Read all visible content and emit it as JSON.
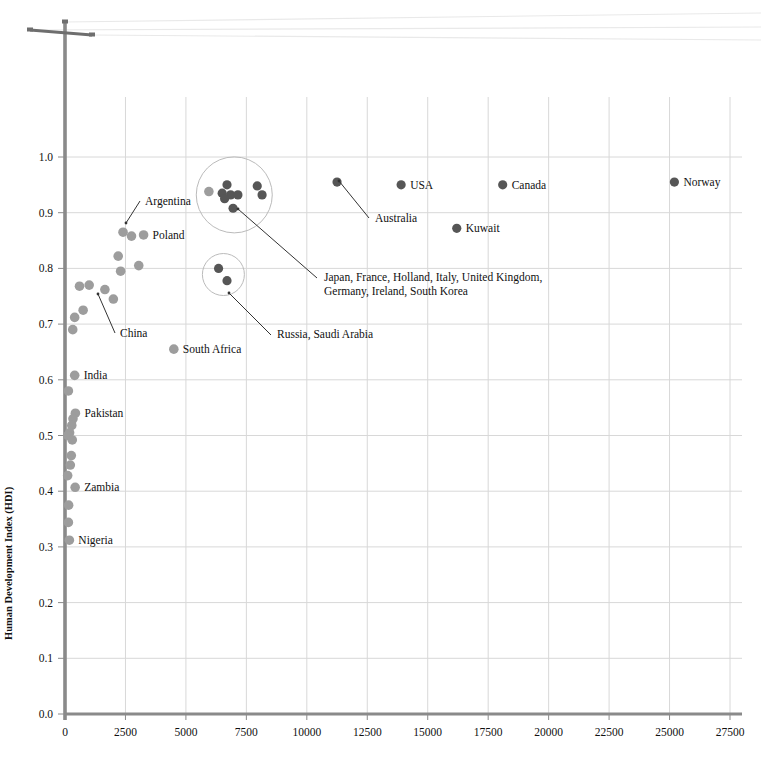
{
  "chart_data": {
    "type": "scatter",
    "title": "",
    "xlabel": "",
    "ylabel": "Human Development Index (HDI)",
    "xlim": [
      0,
      27500
    ],
    "ylim": [
      0.0,
      1.0
    ],
    "grid": true,
    "legend": "none",
    "xticks": [
      0,
      2500,
      5000,
      7500,
      10000,
      12500,
      15000,
      17500,
      20000,
      22500,
      25000,
      27500
    ],
    "xtick_labels": [
      "0",
      "2500",
      "5000",
      "7500",
      "10000",
      "12500",
      "15000",
      "17500",
      "20000",
      "22500",
      "25000",
      "27500"
    ],
    "yticks": [
      0.0,
      0.1,
      0.2,
      0.3,
      0.4,
      0.5,
      0.6,
      0.7,
      0.8,
      0.9,
      1.0
    ],
    "ytick_labels": [
      "0.0",
      "0.1",
      "0.2",
      "0.3",
      "0.4",
      "0.5",
      "0.6",
      "0.7",
      "0.8",
      "0.9",
      "1.0"
    ],
    "marker_colors": {
      "light": "#9d9d9d",
      "dark": "#565656",
      "axis": "#8a8a8a",
      "grid": "#d8d8d8"
    },
    "points": [
      {
        "name": "Norway",
        "x": 25200,
        "y": 0.955,
        "tone": "dark",
        "label": "Norway",
        "label_pos": "right"
      },
      {
        "name": "Canada",
        "x": 18100,
        "y": 0.95,
        "tone": "dark",
        "label": "Canada",
        "label_pos": "right"
      },
      {
        "name": "USA",
        "x": 13900,
        "y": 0.95,
        "tone": "dark",
        "label": "USA",
        "label_pos": "right"
      },
      {
        "name": "Kuwait",
        "x": 16200,
        "y": 0.872,
        "tone": "dark",
        "label": "Kuwait",
        "label_pos": "right"
      },
      {
        "name": "Australia",
        "x": 11250,
        "y": 0.955,
        "tone": "dark",
        "label": "Australia",
        "label_pos": "leader"
      },
      {
        "name": "Poland",
        "x": 3250,
        "y": 0.86,
        "tone": "light",
        "label": "Poland",
        "label_pos": "right"
      },
      {
        "name": "Argentina",
        "x": 2400,
        "y": 0.865,
        "tone": "light",
        "label": "Argentina",
        "label_pos": "leader"
      },
      {
        "name": "China",
        "x": 1000,
        "y": 0.77,
        "tone": "light",
        "label": "China",
        "label_pos": "leader"
      },
      {
        "name": "South Africa",
        "x": 4500,
        "y": 0.655,
        "tone": "light",
        "label": "South Africa",
        "label_pos": "right"
      },
      {
        "name": "India",
        "x": 400,
        "y": 0.608,
        "tone": "light",
        "label": "India",
        "label_pos": "right"
      },
      {
        "name": "Pakistan",
        "x": 430,
        "y": 0.54,
        "tone": "light",
        "label": "Pakistan",
        "label_pos": "right"
      },
      {
        "name": "Zambia",
        "x": 420,
        "y": 0.407,
        "tone": "light",
        "label": "Zambia",
        "label_pos": "right"
      },
      {
        "name": "Nigeria",
        "x": 180,
        "y": 0.312,
        "tone": "light",
        "label": "Nigeria",
        "label_pos": "right"
      },
      {
        "name": "unlabeled-01",
        "x": 2750,
        "y": 0.858,
        "tone": "light",
        "label": "",
        "label_pos": "none"
      },
      {
        "name": "unlabeled-02",
        "x": 2200,
        "y": 0.822,
        "tone": "light",
        "label": "",
        "label_pos": "none"
      },
      {
        "name": "unlabeled-03",
        "x": 3050,
        "y": 0.805,
        "tone": "light",
        "label": "",
        "label_pos": "none"
      },
      {
        "name": "unlabeled-04",
        "x": 2300,
        "y": 0.795,
        "tone": "light",
        "label": "",
        "label_pos": "none"
      },
      {
        "name": "unlabeled-05",
        "x": 1650,
        "y": 0.762,
        "tone": "light",
        "label": "",
        "label_pos": "none"
      },
      {
        "name": "unlabeled-06",
        "x": 2000,
        "y": 0.745,
        "tone": "light",
        "label": "",
        "label_pos": "none"
      },
      {
        "name": "unlabeled-07",
        "x": 600,
        "y": 0.768,
        "tone": "light",
        "label": "",
        "label_pos": "none"
      },
      {
        "name": "unlabeled-08",
        "x": 750,
        "y": 0.725,
        "tone": "light",
        "label": "",
        "label_pos": "none"
      },
      {
        "name": "unlabeled-09",
        "x": 400,
        "y": 0.712,
        "tone": "light",
        "label": "",
        "label_pos": "none"
      },
      {
        "name": "unlabeled-10",
        "x": 320,
        "y": 0.69,
        "tone": "light",
        "label": "",
        "label_pos": "none"
      },
      {
        "name": "unlabeled-11",
        "x": 140,
        "y": 0.58,
        "tone": "light",
        "label": "",
        "label_pos": "none"
      },
      {
        "name": "unlabeled-12",
        "x": 330,
        "y": 0.53,
        "tone": "light",
        "label": "",
        "label_pos": "none"
      },
      {
        "name": "unlabeled-13",
        "x": 280,
        "y": 0.518,
        "tone": "light",
        "label": "",
        "label_pos": "none"
      },
      {
        "name": "unlabeled-14",
        "x": 190,
        "y": 0.505,
        "tone": "light",
        "label": "",
        "label_pos": "none"
      },
      {
        "name": "unlabeled-15",
        "x": 120,
        "y": 0.5,
        "tone": "light",
        "label": "",
        "label_pos": "none"
      },
      {
        "name": "unlabeled-16",
        "x": 300,
        "y": 0.492,
        "tone": "light",
        "label": "",
        "label_pos": "none"
      },
      {
        "name": "unlabeled-17",
        "x": 260,
        "y": 0.464,
        "tone": "light",
        "label": "",
        "label_pos": "none"
      },
      {
        "name": "unlabeled-18",
        "x": 220,
        "y": 0.447,
        "tone": "light",
        "label": "",
        "label_pos": "none"
      },
      {
        "name": "unlabeled-19",
        "x": 110,
        "y": 0.428,
        "tone": "light",
        "label": "",
        "label_pos": "none"
      },
      {
        "name": "unlabeled-20",
        "x": 150,
        "y": 0.375,
        "tone": "light",
        "label": "",
        "label_pos": "none"
      },
      {
        "name": "unlabeled-21",
        "x": 140,
        "y": 0.344,
        "tone": "light",
        "label": "",
        "label_pos": "none"
      },
      {
        "name": "cluster-a-01",
        "x": 5950,
        "y": 0.938,
        "tone": "light",
        "label": "",
        "label_pos": "none"
      },
      {
        "name": "cluster-a-02",
        "x": 6700,
        "y": 0.95,
        "tone": "dark",
        "label": "",
        "label_pos": "none"
      },
      {
        "name": "cluster-a-03",
        "x": 6500,
        "y": 0.935,
        "tone": "dark",
        "label": "",
        "label_pos": "none"
      },
      {
        "name": "cluster-a-04",
        "x": 6850,
        "y": 0.932,
        "tone": "dark",
        "label": "",
        "label_pos": "none"
      },
      {
        "name": "cluster-a-05",
        "x": 6600,
        "y": 0.925,
        "tone": "dark",
        "label": "",
        "label_pos": "none"
      },
      {
        "name": "cluster-a-06",
        "x": 7150,
        "y": 0.932,
        "tone": "dark",
        "label": "",
        "label_pos": "none"
      },
      {
        "name": "cluster-a-07",
        "x": 6950,
        "y": 0.908,
        "tone": "dark",
        "label": "",
        "label_pos": "none"
      },
      {
        "name": "cluster-a-08",
        "x": 7950,
        "y": 0.948,
        "tone": "dark",
        "label": "",
        "label_pos": "none"
      },
      {
        "name": "cluster-a-09",
        "x": 8150,
        "y": 0.932,
        "tone": "dark",
        "label": "",
        "label_pos": "none"
      },
      {
        "name": "cluster-b-01",
        "x": 6350,
        "y": 0.8,
        "tone": "dark",
        "label": "",
        "label_pos": "none"
      },
      {
        "name": "cluster-b-02",
        "x": 6700,
        "y": 0.778,
        "tone": "dark",
        "label": "",
        "label_pos": "none"
      }
    ],
    "cluster_circles": [
      {
        "name": "developed-nations-circle",
        "cx": 7000,
        "cy": 0.932,
        "rx_px": 38,
        "ry_px": 38
      },
      {
        "name": "resource-nations-circle",
        "cx": 6550,
        "cy": 0.789,
        "rx_px": 21,
        "ry_px": 21
      }
    ],
    "annotations": [
      {
        "name": "developed-nations-annotation",
        "lines": [
          "Japan, France, Holland, Italy, United Kingdom,",
          "Germany, Ireland, South Korea"
        ],
        "text_x_px": 324,
        "text_y_px": 281,
        "leader_from_px": [
          317,
          278
        ],
        "leader_to_px": [
          238,
          209
        ]
      },
      {
        "name": "resource-nations-annotation",
        "lines": [
          "Russia, Saudi Arabia"
        ],
        "text_x_px": 277,
        "text_y_px": 338,
        "leader_from_px": [
          271,
          335
        ],
        "leader_to_px": [
          229,
          293
        ]
      },
      {
        "name": "australia-annotation",
        "lines": [
          "Australia"
        ],
        "text_x_px": 375,
        "text_y_px": 222,
        "leader_from_px": [
          369,
          218
        ],
        "leader_to_px": [
          339,
          181
        ]
      },
      {
        "name": "argentina-annotation",
        "lines": [
          "Argentina"
        ],
        "text_x_px": 145,
        "text_y_px": 205,
        "leader_from_px": [
          140,
          201
        ],
        "leader_to_px": [
          126,
          223
        ]
      },
      {
        "name": "china-annotation",
        "lines": [
          "China"
        ],
        "text_x_px": 120,
        "text_y_px": 337,
        "leader_from_px": [
          115,
          333
        ],
        "leader_to_px": [
          98,
          294
        ]
      }
    ],
    "decoration": {
      "name": "utility-pole-power-lines",
      "description": "y-axis rendered as a utility pole with crossbar and three power lines running to the right edge",
      "pole_x_px": 65,
      "crossbar": {
        "x1": 30,
        "y1": 30,
        "x2": 92,
        "y2": 35
      },
      "power_lines": [
        {
          "x1": 65,
          "y1": 22,
          "x2": 761,
          "y2": 13
        },
        {
          "x1": 31,
          "y1": 30,
          "x2": 761,
          "y2": 27
        },
        {
          "x1": 92,
          "y1": 35,
          "x2": 761,
          "y2": 40
        }
      ]
    }
  }
}
